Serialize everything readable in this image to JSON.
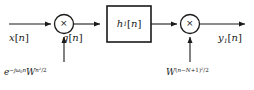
{
  "figure": {
    "background_color": "#ffffff",
    "line_color": "#1a1a1a"
  },
  "nodes": {
    "input": {
      "label": "x[n]",
      "base": "x",
      "index": "n"
    },
    "intermediate": {
      "label": "g[n]",
      "base": "g",
      "index": "n"
    },
    "output": {
      "label": "y₁[n]",
      "base": "y",
      "subscript": "1",
      "index": "n"
    },
    "filter_block": {
      "label": "h₁[n]",
      "base": "h",
      "subscript": "1",
      "index": "n"
    },
    "multiplier_left": {
      "symbol": "×",
      "type": "multiplier"
    },
    "multiplier_right": {
      "symbol": "×",
      "type": "multiplier"
    }
  },
  "modulation": {
    "left": {
      "full": "e^{-jω₀n} W^{n²/2}",
      "exp_base": "e",
      "exp_sign": "−",
      "exp_j": "j",
      "exp_omega": "ω",
      "exp_omega_sub": "0",
      "exp_n": "n",
      "w_base": "W",
      "w_exp_n": "n",
      "w_exp_pow": "2",
      "w_exp_div": "/2"
    },
    "right": {
      "full": "W^{(n − N + 1)²/2}",
      "w_base": "W",
      "open": "(",
      "n": "n",
      "minus": "−",
      "N": "N",
      "plus": "+",
      "one": "1",
      "close": ")",
      "pow": "2",
      "div": "/2"
    }
  }
}
